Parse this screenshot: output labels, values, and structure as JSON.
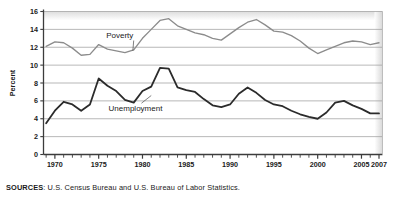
{
  "chart_data": {
    "type": "line",
    "title": "",
    "xlabel": "",
    "ylabel": "Percent",
    "xlim": [
      1968.7,
      2007.4
    ],
    "ylim": [
      0,
      16
    ],
    "grid": true,
    "legend_position": "inline-annotations",
    "y_ticks": [
      0,
      2,
      4,
      6,
      8,
      10,
      12,
      14,
      16
    ],
    "y_tick_labels": [
      "0",
      "2",
      "4",
      "6",
      "8",
      "10",
      "12",
      "14",
      "16"
    ],
    "x_ticks": [
      1970,
      1975,
      1980,
      1985,
      1990,
      1995,
      2000,
      2005,
      2007
    ],
    "x_tick_labels": [
      "1970",
      "1975",
      "1980",
      "1985",
      "1990",
      "1995",
      "2000",
      "2005",
      "2007"
    ],
    "x_minor_tick_interval": 1,
    "x": [
      1969,
      1970,
      1971,
      1972,
      1973,
      1974,
      1975,
      1976,
      1977,
      1978,
      1979,
      1980,
      1981,
      1982,
      1983,
      1984,
      1985,
      1986,
      1987,
      1988,
      1989,
      1990,
      1991,
      1992,
      1993,
      1994,
      1995,
      1996,
      1997,
      1998,
      1999,
      2000,
      2001,
      2002,
      2003,
      2004,
      2005,
      2006,
      2007
    ],
    "series": [
      {
        "name": "Poverty",
        "color": "#8c8c8c",
        "label_x": 1977.4,
        "label_y": 13.0,
        "leader_to_x": 1978.9,
        "leader_to_y": 11.6,
        "values": [
          12.1,
          12.6,
          12.5,
          11.9,
          11.1,
          11.2,
          12.3,
          11.8,
          11.6,
          11.4,
          11.7,
          13.0,
          14.0,
          15.0,
          15.2,
          14.4,
          14.0,
          13.6,
          13.4,
          13.0,
          12.8,
          13.5,
          14.2,
          14.8,
          15.1,
          14.5,
          13.8,
          13.7,
          13.3,
          12.7,
          11.9,
          11.3,
          11.7,
          12.1,
          12.5,
          12.7,
          12.6,
          12.3,
          12.5
        ]
      },
      {
        "name": "Unemployment",
        "color": "#2b2b2b",
        "label_x": 1979.2,
        "label_y": 4.9,
        "leader_to_x": 1981.0,
        "leader_to_y": 6.6,
        "values": [
          3.5,
          4.9,
          5.9,
          5.6,
          4.9,
          5.6,
          8.5,
          7.7,
          7.1,
          6.1,
          5.8,
          7.1,
          7.6,
          9.7,
          9.6,
          7.5,
          7.2,
          7.0,
          6.2,
          5.5,
          5.3,
          5.6,
          6.8,
          7.5,
          6.9,
          6.1,
          5.6,
          5.4,
          4.9,
          4.5,
          4.2,
          4.0,
          4.7,
          5.8,
          6.0,
          5.5,
          5.1,
          4.6,
          4.6
        ]
      }
    ]
  },
  "source_note": {
    "label": "SOURCES",
    "separator": ": ",
    "text": "U.S. Census Bureau and U.S. Bureau of Labor Statistics."
  }
}
